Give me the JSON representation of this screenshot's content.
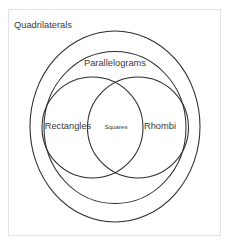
{
  "diagram": {
    "type": "venn",
    "background_color": "#ffffff",
    "frame_color": "#e2e2e2",
    "stroke_color": "#2b2b2b",
    "text_color": "#3a3a3a",
    "sets": {
      "universe": {
        "label": "Quadrilaterals",
        "name": "quadrilaterals-set"
      },
      "outer": {
        "label": "Parallelograms",
        "name": "parallelograms-set"
      },
      "left": {
        "label": "Rectangles",
        "name": "rectangles-set"
      },
      "right": {
        "label": "Rhombi",
        "name": "rhombi-set"
      },
      "intersection": {
        "label": "Squares",
        "name": "squares-set"
      }
    }
  }
}
